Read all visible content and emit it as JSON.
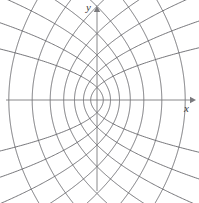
{
  "figure": {
    "name": "orthogonal-families-of-confocal-parabolas",
    "background_color": "#ffffff",
    "curve_color": "#5f5f63",
    "axis_color": "#7a7a7e",
    "label_color": "#3a3a3a",
    "width": 199,
    "height": 203
  },
  "axes": {
    "x_label": "x",
    "y_label": "y",
    "origin": {
      "x": 97,
      "y": 100
    },
    "x_axis": {
      "x1": 6,
      "y1": 100,
      "x2": 190,
      "y2": 100,
      "arrow": "right"
    },
    "y_axis": {
      "x1": 97,
      "y1": 191,
      "x2": 97,
      "y2": 12,
      "arrow": "up"
    }
  },
  "chart_data": {
    "type": "line",
    "title": "",
    "subtitle": "",
    "xlabel": "x",
    "ylabel": "y",
    "xlim": [
      -5.2,
      5.2
    ],
    "ylim": [
      -5.2,
      5.2
    ],
    "grid": false,
    "legend": null,
    "pixels_per_unit_x": 18,
    "pixels_per_unit_y": 18,
    "series": [
      {
        "name": "parabolas-opening-left",
        "equation": "y^2 = 4a(a - x)",
        "orientation": "left",
        "color": "#5f5f63",
        "parameters": [
          0.35,
          0.75,
          1.25,
          1.85,
          2.6,
          3.6,
          4.9
        ]
      },
      {
        "name": "parabolas-opening-right",
        "equation": "y^2 = 4b(b + x)",
        "orientation": "right",
        "color": "#5f5f63",
        "parameters": [
          0.35,
          0.75,
          1.25,
          1.85,
          2.6,
          3.6,
          4.9
        ]
      }
    ]
  }
}
